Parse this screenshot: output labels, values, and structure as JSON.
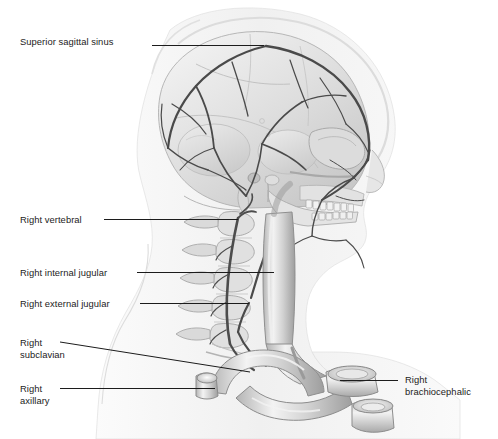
{
  "figure": {
    "view": "lateral right",
    "background_color": "#ffffff",
    "ink_color": "#1c1c1c",
    "vessel_color": "#4a4a4a",
    "bone_light": "#e9e9e9",
    "bone_mid": "#cfcfcf",
    "bone_dark": "#a8a8a8",
    "soft_tissue": "#f2f2f2"
  },
  "labels": [
    {
      "id": "superior-sagittal-sinus",
      "text": "Superior sagittal sinus",
      "x": 20,
      "y": 36,
      "align": "left",
      "leader": {
        "x1": 152,
        "y1": 45,
        "x2": 264,
        "y2": 45
      }
    },
    {
      "id": "right-vertebral",
      "text": "Right vertebral",
      "x": 20,
      "y": 214,
      "align": "left",
      "leader": {
        "x1": 104,
        "y1": 219,
        "x2": 238,
        "y2": 219
      }
    },
    {
      "id": "right-internal-jugular",
      "text": "Right internal jugular",
      "x": 20,
      "y": 267,
      "align": "left",
      "leader": {
        "x1": 137,
        "y1": 272,
        "x2": 274,
        "y2": 272
      }
    },
    {
      "id": "right-external-jugular",
      "text": "Right external jugular",
      "x": 20,
      "y": 298,
      "align": "left",
      "leader": {
        "x1": 140,
        "y1": 303,
        "x2": 249,
        "y2": 303
      }
    },
    {
      "id": "right-subclavian",
      "text": "Right\nsubclavian",
      "x": 20,
      "y": 337,
      "align": "left",
      "leader": {
        "x1": 60,
        "y1": 342,
        "x2": 250,
        "y2": 372
      }
    },
    {
      "id": "right-axillary",
      "text": "Right\naxillary",
      "x": 20,
      "y": 383,
      "align": "left",
      "leader": {
        "x1": 60,
        "y1": 388,
        "x2": 215,
        "y2": 388
      }
    },
    {
      "id": "right-brachiocephalic",
      "text": "Right\nbrachiocephalic",
      "x": 405,
      "y": 374,
      "align": "left",
      "leader": {
        "x1": 340,
        "y1": 380,
        "x2": 398,
        "y2": 380
      }
    }
  ]
}
